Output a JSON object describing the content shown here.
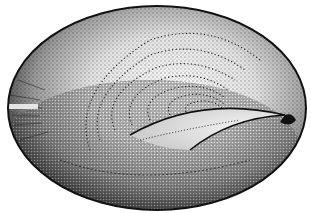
{
  "image": {
    "subject": "Stippled pen illustration of a limpet shell viewed from above",
    "colors": {
      "background": "#ffffff",
      "ink": "#111111",
      "mid_tone": "#777777",
      "highlight": "#f4f4f4"
    },
    "shell": {
      "outline": {
        "cx": 157,
        "cy": 108,
        "rx": 149,
        "ry": 102
      },
      "apex": {
        "x": 285,
        "y": 115
      },
      "growth_rings": 7
    }
  }
}
